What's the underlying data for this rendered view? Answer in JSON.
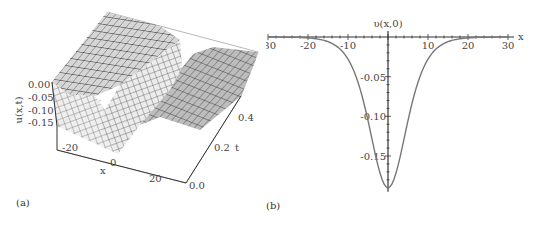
{
  "panels": {
    "a": {
      "label": "(a)"
    },
    "b": {
      "label": "(b)"
    }
  },
  "chart_data": [
    {
      "type": "surface3d",
      "panel": "(a)",
      "title": "",
      "zlabel": "u(x,t)",
      "xlabel": "x",
      "ylabel": "t",
      "z_ticks": [
        "0.00",
        "-0.05",
        "-0.10",
        "-0.15"
      ],
      "x_ticks": [
        "-20",
        "0",
        "20"
      ],
      "t_ticks": [
        "0.0",
        "0.2",
        "0.4"
      ],
      "x_range": [
        -30,
        30
      ],
      "t_range": [
        0,
        0.5
      ],
      "z_range": [
        -0.19,
        0
      ],
      "description": "Single soliton (trough) solution: u(x,t) approx -0.19 sech^2 profile centered near x=0, translating slowly with t; rendered as gray meshed surface",
      "trough_min": -0.19
    },
    {
      "type": "line",
      "panel": "(b)",
      "title": "υ(x,0)",
      "xlabel": "x",
      "ylabel": "υ(x,0)",
      "x_ticks": [
        "-30",
        "-20",
        "-10",
        "10",
        "20",
        "30"
      ],
      "y_ticks": [
        "-0.05",
        "-0.10",
        "-0.15"
      ],
      "xlim": [
        -30,
        30
      ],
      "ylim": [
        -0.19,
        0
      ],
      "grid": false,
      "series": [
        {
          "name": "υ(x,0)",
          "x": [
            -30,
            -25,
            -20,
            -15,
            -12,
            -10,
            -8,
            -6,
            -4,
            -2,
            0,
            2,
            4,
            6,
            8,
            10,
            12,
            15,
            20,
            25,
            30
          ],
          "values": [
            0.0,
            -0.0005,
            -0.002,
            -0.009,
            -0.019,
            -0.031,
            -0.048,
            -0.076,
            -0.115,
            -0.163,
            -0.19,
            -0.163,
            -0.115,
            -0.076,
            -0.048,
            -0.031,
            -0.019,
            -0.009,
            -0.002,
            -0.0005,
            0.0
          ]
        }
      ]
    }
  ]
}
